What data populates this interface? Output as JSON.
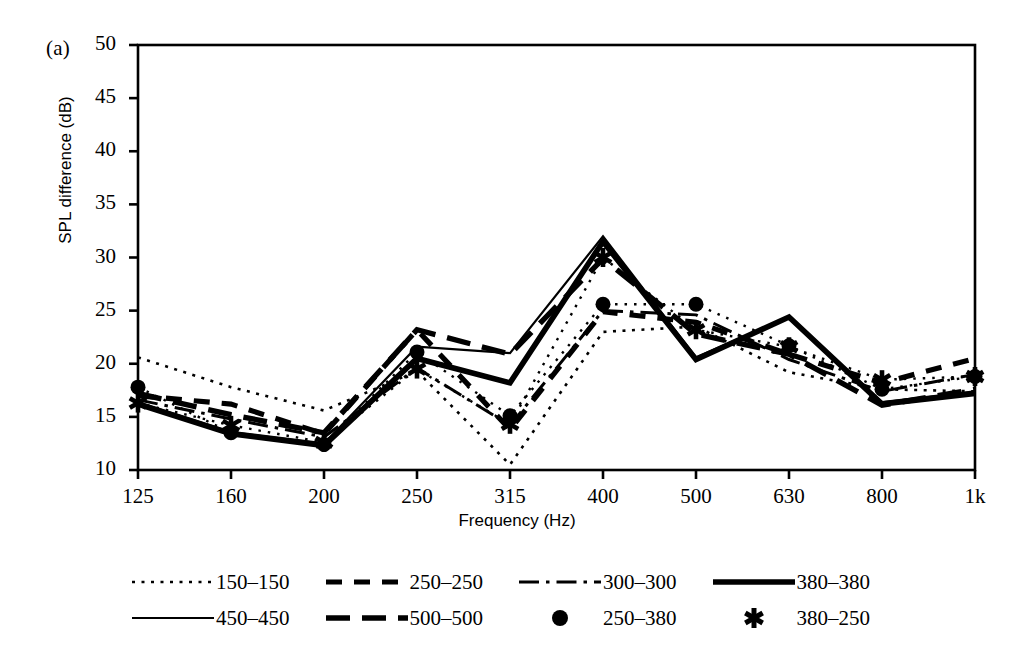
{
  "panel": {
    "label": "(a)"
  },
  "axes": {
    "ylabel": "SPL difference (dB)",
    "xlabel": "Frequency (Hz)",
    "ytick_labels": [
      "50",
      "45",
      "40",
      "35",
      "30",
      "25",
      "20",
      "15",
      "10"
    ],
    "xtick_labels": [
      "125",
      "160",
      "200",
      "250",
      "315",
      "400",
      "500",
      "630",
      "800",
      "1k"
    ]
  },
  "legend": {
    "rows": [
      [
        {
          "label": "150–150",
          "style": "dotted"
        },
        {
          "label": "250–250",
          "style": "dashed"
        },
        {
          "label": "300–300",
          "style": "dashdot"
        },
        {
          "label": "380–380",
          "style": "thick-solid"
        }
      ],
      [
        {
          "label": "450–450",
          "style": "thin-solid"
        },
        {
          "label": "500–500",
          "style": "thick-dashed"
        },
        {
          "label": "250–380",
          "style": "circle-marker"
        },
        {
          "label": "380–250",
          "style": "star-marker"
        }
      ]
    ]
  },
  "colors": {
    "line": "#000000",
    "axis": "#000000",
    "background": "#ffffff"
  },
  "chart_data": {
    "type": "line",
    "title": "",
    "xlabel": "Frequency (Hz)",
    "ylabel": "SPL difference (dB)",
    "categories": [
      "125",
      "160",
      "200",
      "250",
      "315",
      "400",
      "500",
      "630",
      "800",
      "1k"
    ],
    "xlim": [
      0,
      9
    ],
    "ylim": [
      10,
      50
    ],
    "ytick_step": 5,
    "grid": false,
    "legend_position": "below",
    "series": [
      {
        "name": "150–150",
        "style": "dotted",
        "values": [
          20.6,
          17.8,
          15.6,
          19.3,
          10.5,
          23.0,
          23.5,
          19.2,
          17.6,
          17.4
        ]
      },
      {
        "name": "250–250",
        "style": "dashed",
        "values": [
          17.0,
          16.2,
          13.4,
          23.2,
          13.8,
          24.9,
          23.9,
          20.9,
          18.2,
          20.5
        ]
      },
      {
        "name": "300–300",
        "style": "dashdot",
        "values": [
          16.6,
          14.8,
          13.1,
          19.6,
          14.2,
          25.0,
          24.6,
          20.4,
          17.4,
          19.0
        ]
      },
      {
        "name": "380–380",
        "style": "thick-solid",
        "values": [
          16.2,
          13.4,
          12.3,
          20.5,
          18.2,
          31.5,
          20.4,
          24.4,
          16.2,
          17.2
        ]
      },
      {
        "name": "450–450",
        "style": "thin-solid",
        "values": [
          16.4,
          13.6,
          12.5,
          21.6,
          21.0,
          32.0,
          20.6,
          24.4,
          16.4,
          17.4
        ]
      },
      {
        "name": "500–500",
        "style": "thick-dashed",
        "values": [
          17.2,
          15.2,
          13.5,
          23.2,
          20.9,
          29.9,
          22.8,
          20.9,
          16.1,
          17.6
        ]
      },
      {
        "name": "250–380",
        "style": "circle-marker",
        "values": [
          17.8,
          13.5,
          12.4,
          21.1,
          15.1,
          25.6,
          25.6,
          21.7,
          17.6,
          18.8
        ]
      },
      {
        "name": "380–250",
        "style": "star-marker",
        "values": [
          16.3,
          14.2,
          12.6,
          19.5,
          14.3,
          30.0,
          23.2,
          21.6,
          18.5,
          18.8
        ]
      }
    ]
  }
}
